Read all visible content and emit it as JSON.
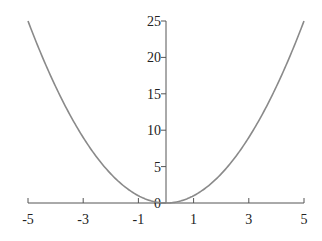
{
  "chart_data": {
    "type": "line",
    "title": "",
    "xlabel": "",
    "ylabel": "",
    "function": "y = x^2",
    "xlim": [
      -5,
      5
    ],
    "ylim": [
      0,
      25
    ],
    "grid": false,
    "legend": null,
    "x_ticks": [
      -5,
      -3,
      -1,
      1,
      3,
      5
    ],
    "x_tick_labels": [
      "-5",
      "-3",
      "-1",
      "1",
      "3",
      "5"
    ],
    "y_ticks": [
      0,
      5,
      10,
      15,
      20,
      25
    ],
    "y_tick_labels": [
      "0",
      "5",
      "10",
      "15",
      "20",
      "25"
    ],
    "series": [
      {
        "name": "x^2",
        "color": "#8a8a8a",
        "x": [
          -5,
          -4.5,
          -4,
          -3.5,
          -3,
          -2.5,
          -2,
          -1.5,
          -1,
          -0.5,
          0,
          0.5,
          1,
          1.5,
          2,
          2.5,
          3,
          3.5,
          4,
          4.5,
          5
        ],
        "y": [
          25,
          20.25,
          16,
          12.25,
          9,
          6.25,
          4,
          2.25,
          1,
          0.25,
          0,
          0.25,
          1,
          2.25,
          4,
          6.25,
          9,
          12.25,
          16,
          20.25,
          25
        ]
      }
    ],
    "axis_color": "#555555"
  }
}
